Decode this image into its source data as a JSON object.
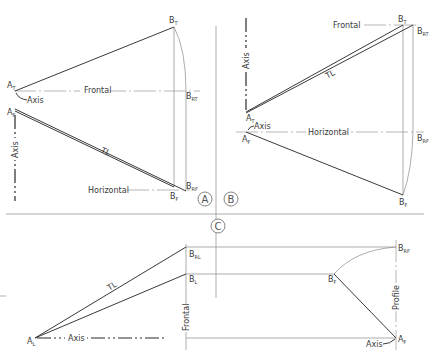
{
  "figure": {
    "panels": [
      {
        "id": "A",
        "circle_label": "A",
        "labels": {
          "a_top": {
            "main": "A",
            "sub": "T"
          },
          "a_front": {
            "main": "A",
            "sub": "F"
          },
          "b_top": {
            "main": "B",
            "sub": "T"
          },
          "b_rt": {
            "main": "B",
            "sub": "RT"
          },
          "b_rf": {
            "main": "B",
            "sub": "RF"
          },
          "b_front": {
            "main": "B",
            "sub": "F"
          },
          "axis_pointer": "Axis",
          "axis_vertical": "Axis",
          "frontal": "Frontal",
          "horizontal": "Horizontal",
          "true_length": "TL"
        }
      },
      {
        "id": "B",
        "circle_label": "B",
        "labels": {
          "a_top": {
            "main": "A",
            "sub": "T"
          },
          "a_front": {
            "main": "A",
            "sub": "F"
          },
          "b_top": {
            "main": "B",
            "sub": "T"
          },
          "b_rt": {
            "main": "B",
            "sub": "RT"
          },
          "b_rf": {
            "main": "B",
            "sub": "RF"
          },
          "b_front": {
            "main": "B",
            "sub": "F"
          },
          "axis_pointer": "Axis",
          "axis_vertical": "Axis",
          "frontal": "Frontal",
          "horizontal": "Horizontal",
          "true_length": "TL"
        }
      },
      {
        "id": "C",
        "circle_label": "C",
        "labels": {
          "a_left": {
            "main": "A",
            "sub": "L"
          },
          "a_front": {
            "main": "A",
            "sub": "F"
          },
          "b_rl": {
            "main": "B",
            "sub": "RL"
          },
          "b_left": {
            "main": "B",
            "sub": "L"
          },
          "b_front": {
            "main": "B",
            "sub": "F"
          },
          "b_rf": {
            "main": "B",
            "sub": "RF"
          },
          "axis_horizontal": "Axis",
          "axis_pointer": "Axis",
          "frontal": "Frontal",
          "profile": "Profile",
          "true_length": "TL"
        }
      }
    ]
  }
}
